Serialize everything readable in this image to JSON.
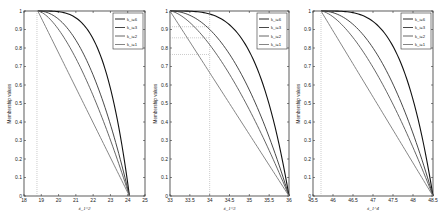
{
  "chart_data": [
    {
      "type": "line",
      "title": "",
      "xlabel": "x̃_1^2",
      "ylabel": "Membership values",
      "xlim": [
        18,
        25
      ],
      "ylim": [
        0,
        1
      ],
      "xticks": [
        "18",
        "19",
        "20",
        "21",
        "22",
        "23",
        "24",
        "25"
      ],
      "yticks": [
        "0",
        "0.1",
        "0.2",
        "0.3",
        "0.4",
        "0.5",
        "0.6",
        "0.7",
        "0.8",
        "0.9",
        "1"
      ],
      "x_start": 18.8,
      "x_end": 24.1,
      "guides": {
        "vertical_x": 18.75,
        "horizontal_y": []
      },
      "legend_position": "top-right",
      "series": [
        {
          "name": "k_i=6",
          "k": 6,
          "color": "#111111"
        },
        {
          "name": "k_i=3",
          "k": 3,
          "color": "#333333"
        },
        {
          "name": "k_i=2",
          "k": 2,
          "color": "#555555"
        },
        {
          "name": "k_i=1",
          "k": 1,
          "color": "#777777"
        }
      ]
    },
    {
      "type": "line",
      "title": "",
      "xlabel": "x̃_1^3",
      "ylabel": "Membership values",
      "xlim": [
        33,
        36
      ],
      "ylim": [
        0,
        1
      ],
      "xticks": [
        "33",
        "33.5",
        "34",
        "34.5",
        "35",
        "35.5",
        "36"
      ],
      "yticks": [
        "0",
        "0.1",
        "0.2",
        "0.3",
        "0.4",
        "0.5",
        "0.6",
        "0.7",
        "0.8",
        "0.9",
        "1"
      ],
      "x_start": 33,
      "x_end": 36,
      "guides": {
        "vertical_x": 34,
        "horizontal_y": [
          0.915,
          0.855,
          0.765
        ]
      },
      "legend_position": "top-right",
      "series": [
        {
          "name": "k_i=6",
          "k": 6,
          "color": "#111111"
        },
        {
          "name": "k_i=3",
          "k": 3,
          "color": "#333333"
        },
        {
          "name": "k_i=2",
          "k": 2,
          "color": "#555555"
        },
        {
          "name": "k_i=1",
          "k": 1,
          "color": "#777777"
        }
      ]
    },
    {
      "type": "line",
      "title": "",
      "xlabel": "x̃_1^4",
      "ylabel": "Membership values",
      "xlim": [
        45.5,
        48.5
      ],
      "ylim": [
        0,
        1
      ],
      "xticks": [
        "45.5",
        "46",
        "46.5",
        "47",
        "47.5",
        "48",
        "48.5"
      ],
      "yticks": [
        "0",
        "0.1",
        "0.2",
        "0.3",
        "0.4",
        "0.5",
        "0.6",
        "0.7",
        "0.8",
        "0.9",
        "1"
      ],
      "x_start": 45.7,
      "x_end": 48.5,
      "guides": {
        "vertical_x": 45.7,
        "horizontal_y": []
      },
      "legend_position": "top-right",
      "series": [
        {
          "name": "k_i=6",
          "k": 6,
          "color": "#111111"
        },
        {
          "name": "k_i=3",
          "k": 3,
          "color": "#333333"
        },
        {
          "name": "k_i=2",
          "k": 2,
          "color": "#555555"
        },
        {
          "name": "k_i=1",
          "k": 1,
          "color": "#777777"
        }
      ]
    }
  ]
}
